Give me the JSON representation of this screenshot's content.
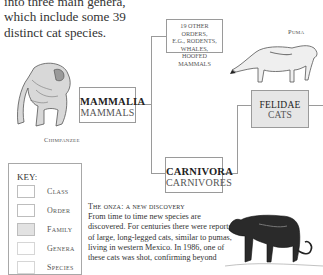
{
  "intro": {
    "text": "into three main genera, which include some 39 distinct cat species."
  },
  "illustrations": {
    "chimpanzee_caption": "Chimpanzee",
    "puma_caption": "Puma"
  },
  "tree": {
    "mammalia": {
      "title": "MAMMALIA",
      "subtitle": "MAMMALS"
    },
    "other_orders": {
      "line1": "19 OTHER ORDERS,",
      "line2": "E.G., RODENTS,",
      "line3": "WHALES,",
      "line4": "HOOFED MAMMALS"
    },
    "carnivora": {
      "title": "CARNIVORA",
      "subtitle": "CARNIVORES"
    },
    "felidae": {
      "title": "FELIDAE",
      "subtitle": "CATS"
    }
  },
  "key": {
    "title": "KEY:",
    "items": [
      {
        "label": "Class"
      },
      {
        "label": "Order"
      },
      {
        "label": "Family"
      },
      {
        "label": "Genera"
      },
      {
        "label": "Species"
      }
    ]
  },
  "onza": {
    "heading": "The onza: a new discovery",
    "body": "From time to time new species are discovered. For centuries there were reports of large, long-legged cats, similar to pumas, living in western Mexico. In 1986, one of these cats was shot, confirming beyond"
  },
  "colors": {
    "line": "#9a9a9a",
    "family_fill": "#e6e6e6"
  }
}
